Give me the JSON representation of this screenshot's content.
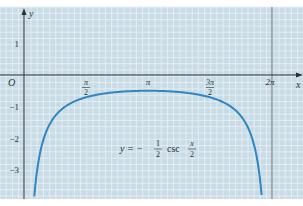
{
  "chart_data": {
    "type": "line",
    "title": "",
    "equation": {
      "prefix": "y = −",
      "frac_num": "1",
      "frac_den": "2",
      "func": "csc",
      "arg_num": "x",
      "arg_den": "2"
    },
    "xlabel": "x",
    "ylabel": "y",
    "origin_label": "O",
    "x_ticks": [
      {
        "value": 1.5708,
        "label_num": "π",
        "label_den": "2"
      },
      {
        "value": 3.1416,
        "label": "π"
      },
      {
        "value": 4.7124,
        "label_num": "3π",
        "label_den": "2"
      },
      {
        "value": 6.2832,
        "label": "2π"
      }
    ],
    "y_ticks": [
      {
        "value": 1,
        "label": "1"
      },
      {
        "value": -1,
        "label": "−1"
      },
      {
        "value": -2,
        "label": "−2"
      },
      {
        "value": -3,
        "label": "−3"
      }
    ],
    "xlim": [
      -0.4,
      6.95
    ],
    "ylim": [
      -3.9,
      2.15
    ],
    "grid": true,
    "asymptote_x": 6.2832,
    "series": [
      {
        "name": "y = -1/2 csc(x/2)",
        "color": "#2f86c0",
        "x": [
          0.26,
          0.35,
          0.5,
          0.75,
          1.0,
          1.2566,
          1.5708,
          2.0,
          2.5,
          3.1416,
          3.78,
          4.28,
          4.7124,
          5.03,
          5.28,
          5.53,
          5.78,
          5.93,
          6.02
        ],
        "y": [
          -3.85,
          -2.87,
          -2.02,
          -1.37,
          -1.04,
          -0.85,
          -0.71,
          -0.59,
          -0.53,
          -0.5,
          -0.53,
          -0.59,
          -0.71,
          -0.85,
          -1.04,
          -1.37,
          -2.02,
          -2.87,
          -3.85
        ]
      }
    ]
  },
  "colors": {
    "background": "#c9dce6",
    "grid_line": "#e8f1f6",
    "axis": "#2a2f35",
    "curve": "#2f86c0"
  }
}
